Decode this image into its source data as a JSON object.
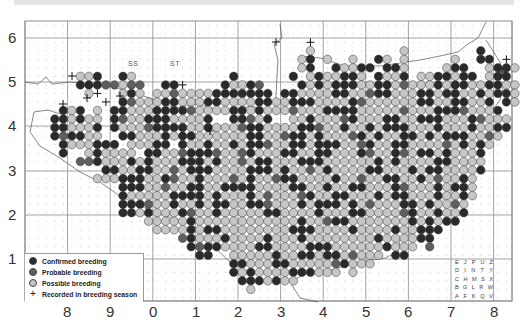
{
  "header": {
    "bar_color": "#e4e4e4"
  },
  "map": {
    "colors": {
      "confirmed": "#2a2a2a",
      "probable": "#5e5e5e",
      "possible": "#c6c6c6",
      "dot_stroke": "#3a3a3a",
      "grid": "#8a8a8a",
      "coast": "#555555",
      "empty_dot": "#c8c8c8"
    },
    "geometry": {
      "left": 25,
      "top": 21,
      "right": 512,
      "bottom": 301,
      "cell": 8.52,
      "major_x": [
        25,
        67.6,
        110.2,
        152.8,
        195.4,
        238,
        280.6,
        323.2,
        365.8,
        408.4,
        451,
        493.6,
        512
      ],
      "major_y": [
        38,
        82,
        126,
        171,
        215,
        259,
        301
      ]
    },
    "y_axis_labels": [
      {
        "label": "6",
        "y": 38
      },
      {
        "label": "5",
        "y": 82
      },
      {
        "label": "4",
        "y": 126
      },
      {
        "label": "3",
        "y": 171
      },
      {
        "label": "2",
        "y": 215
      },
      {
        "label": "1",
        "y": 259
      }
    ],
    "x_axis_labels": [
      {
        "label": "8",
        "x": 67
      },
      {
        "label": "9",
        "x": 110
      },
      {
        "label": "0",
        "x": 153
      },
      {
        "label": "1",
        "x": 196
      },
      {
        "label": "2",
        "x": 238
      },
      {
        "label": "3",
        "x": 281
      },
      {
        "label": "4",
        "x": 323
      },
      {
        "label": "5",
        "x": 366
      },
      {
        "label": "6",
        "x": 408
      },
      {
        "label": "7",
        "x": 451
      },
      {
        "label": "8",
        "x": 494
      }
    ],
    "square_labels": [
      {
        "label": "SS",
        "x": 128,
        "y": 60
      },
      {
        "label": "ST",
        "x": 170,
        "y": 60
      }
    ],
    "rows": [
      ".........................................................",
      ".........................................................",
      ".................................+.......................",
      ".................................O..........O........C....",
      "................................OC.O..O..CO.O.....O..CC.+.",
      "................................OC..COOCC.CCO....OCC..OCCO",
      "......OOC..CO...........C......C.OCOOCCO.COOC.OOCCOCC.OCC.",
      "......CCCPPOPP..CC+....COOCP....COCOCCCOOCCOPOOOCOCCOOCCOO",
      ".......O+..OCO.OOPOOOOCCCCCCC.CCOOOOCCOOPCCOOOCCOCCOOCOCCO",
      ".........+.CPOOOCCOOOCCOOOOCCOOCCCOOOOCPOOOOOOCCOOCCOOC.CO",
      "....COC.O.CCOOOCCCCPOOOOCCOCOOOPOOOCCCCOOOOOPOOOCCCPOOOC..",
      "...CCOCOO.CPOOCCCOOOOC..CCPOC..OOCOOOPCOOOCCOOCCCOOOCPOOO.",
      "...CCOOOC.COOOPCCCCOOCOOOPCCOOOOCCPOOCOOCOCCCOOOCOOOCOOCC.",
      "...CPCCOO..CCOOOCOCCOOOOOOCCOOPCCOCOOOPCOCOOCCOCOCCCOOPO..",
      "....COOOCCC.OOOCC.COOCOOCOCCPOOCCOCCCOOPCOOCCOOOOPOCOCO...",
      "....C..OCOOOO.CCOOPCCCPOOPCOOOCCOOCCOOOCPOOCPOCCOCOOOC....",
      "......PPCOOOCOCOOOCCCOCOOPOCCOOOCCCOOOOOOCOCOOOOCCOOOO....",
      ".........CCOOCCOOPOCCCOOOOCCCOCOOPOCOOOOCCOOOCOCCOOOOC....",
      "........OOOCCCOOCPOOCOOOPOCOOPCCOOOOCOOPOOCCOOCOPOOCO.....",
      "...........CCCOOPOOCCOOCCCCOOOOCCOOCOOCCOOOCPOOOCOCCO.....",
      "...........COOOOOCCCCOCOOOCOPOOOPCOOCCOOOCOCCOOOCOOCO.....",
      "...........CCCPOOCOOCOCCOOCCPOOOCOCCCOCOPOOOCCOCOOPO......",
      "...........CCOCOOOCPOOCOOOOOCCOOOOCOOOCCOOOOPCOOCOOC......",
      "..............OOOOOCOOOOOOOOOOOOCOOPCCOOOOOOOCOCOCC.......",
      "...............OOOOCOCCOOOOOOOOCCCOOOOCOOOOCOOCCC.........",
      "..................PCOOOCOOOOCOOOCOOOOOOOOCOOOOCC..........",
      "...................CPCCOOOOCCOOOOCCCOOOOOOCOOO.P.........",
      "....................CC..OOOOOCOOCCOCCOPOOO.CC.............",
      "........................CCOOOCCOOOOOPCOOO.................",
      "........................COCOOOOCCCOOO.O...................",
      ".........................CCCOCOO..........................",
      "..........................O..............................",
      "........................................................."
    ],
    "plus_markers": [
      {
        "x": 72,
        "y": 76
      },
      {
        "x": 120,
        "y": 96
      },
      {
        "x": 87,
        "y": 98
      },
      {
        "x": 210,
        "y": 131
      },
      {
        "x": 276,
        "y": 42
      },
      {
        "x": 502,
        "y": 72
      },
      {
        "x": 63,
        "y": 104
      }
    ]
  },
  "legend": {
    "items": [
      {
        "label": "Confirmed breeding",
        "type": "confirmed"
      },
      {
        "label": "Probable breeding",
        "type": "probable"
      },
      {
        "label": "Possible breeding",
        "type": "possible"
      },
      {
        "label": "Recorded in breeding season",
        "type": "plus",
        "symbol": "+"
      }
    ]
  },
  "tetrad_key": {
    "rows": [
      [
        "E",
        "J",
        "P",
        "U",
        "Z"
      ],
      [
        "D",
        "I",
        "N",
        "T",
        "Y"
      ],
      [
        "C",
        "H",
        "M",
        "S",
        "X"
      ],
      [
        "B",
        "G",
        "L",
        "R",
        "W"
      ],
      [
        "A",
        "F",
        "K",
        "Q",
        "V"
      ]
    ]
  }
}
